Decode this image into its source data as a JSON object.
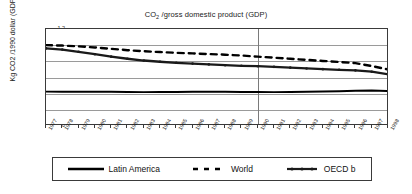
{
  "chart_data": {
    "type": "line",
    "title": "CO2 /gross domestic product (GDP)",
    "title_prefix": "CO",
    "title_sub": "2",
    "title_suffix": " /gross domestic product (GDP)",
    "xlabel": "",
    "ylabel": "Kg CO2 /1990 dollar (GDP) *",
    "ylim": [
      0,
      1.2
    ],
    "yticks": [
      "0",
      "0.2",
      "0.4",
      "0.6",
      "0.8",
      "1",
      "1.2"
    ],
    "ytick_values": [
      0,
      0.2,
      0.4,
      0.6,
      0.8,
      1.0,
      1.2
    ],
    "grid": true,
    "legend_position": "bottom",
    "reference_line_year": "1990",
    "categories": [
      "1977",
      "1978",
      "1979",
      "1980",
      "1981",
      "1982",
      "1983",
      "1984",
      "1985",
      "1986",
      "1987",
      "1988",
      "1989",
      "1990",
      "1991",
      "1992",
      "1993",
      "1994",
      "1995",
      "1996",
      "1997",
      "1998"
    ],
    "series": [
      {
        "name": "Latin America",
        "style": "solid",
        "color": "#000000",
        "values": [
          0.425,
          0.424,
          0.423,
          0.424,
          0.423,
          0.421,
          0.419,
          0.42,
          0.421,
          0.423,
          0.424,
          0.423,
          0.421,
          0.42,
          0.419,
          0.421,
          0.424,
          0.427,
          0.43,
          0.437,
          0.44,
          0.432
        ]
      },
      {
        "name": "World",
        "style": "dashed",
        "color": "#000000",
        "values": [
          1.0,
          0.995,
          0.985,
          0.972,
          0.955,
          0.938,
          0.925,
          0.915,
          0.905,
          0.898,
          0.89,
          0.882,
          0.872,
          0.858,
          0.845,
          0.832,
          0.818,
          0.805,
          0.792,
          0.778,
          0.742,
          0.7
        ]
      },
      {
        "name": "OECD b",
        "style": "thick-marker",
        "color": "#1a1a1a",
        "values": [
          0.96,
          0.945,
          0.918,
          0.888,
          0.858,
          0.832,
          0.81,
          0.795,
          0.782,
          0.772,
          0.762,
          0.752,
          0.745,
          0.74,
          0.732,
          0.722,
          0.712,
          0.703,
          0.695,
          0.688,
          0.672,
          0.64
        ]
      }
    ]
  },
  "legend": {
    "items": [
      {
        "label": "Latin America"
      },
      {
        "label": "World"
      },
      {
        "label": "OECD b"
      }
    ]
  }
}
